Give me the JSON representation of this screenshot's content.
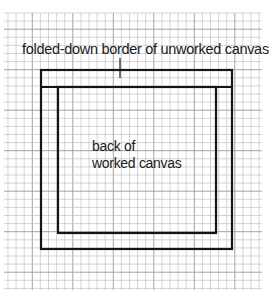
{
  "diagram": {
    "top_label": "folded-down border of unworked canvas",
    "center_label_line1": "back of",
    "center_label_line2": "worked canvas",
    "colors": {
      "background": "#ffffff",
      "grid_line": "#b8b8b8",
      "grid_major": "#9a9a9a",
      "outline": "#151515"
    },
    "grid": {
      "spacing_px": 8.1,
      "origin_x": 8,
      "origin_y": 13,
      "extent_right": 262,
      "extent_bottom": 290
    },
    "outer_rect": {
      "x": 41,
      "y": 70,
      "w": 191,
      "h": 179
    },
    "fold_line_y": 87,
    "inner_rect": {
      "x": 58,
      "y": 87,
      "w": 158,
      "h": 146
    },
    "leader_line": {
      "x": 120,
      "y1": 58,
      "y2": 78
    }
  }
}
